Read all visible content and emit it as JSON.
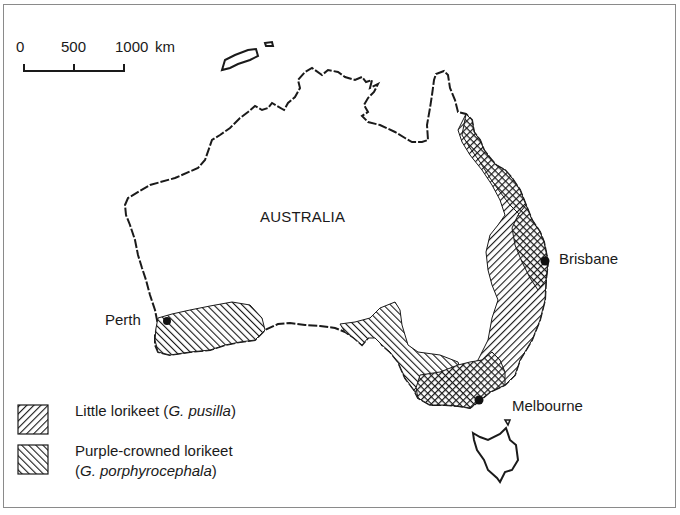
{
  "map": {
    "country_label": "AUSTRALIA",
    "cities": [
      {
        "name": "Perth",
        "x": 167,
        "y": 321
      },
      {
        "name": "Brisbane",
        "x": 545,
        "y": 261
      },
      {
        "name": "Melbourne",
        "x": 479,
        "y": 400
      }
    ]
  },
  "scale_bar": {
    "ticks": [
      "0",
      "500",
      "1000"
    ],
    "unit": "km"
  },
  "legend": {
    "items": [
      {
        "common": "Little lorikeet (",
        "scientific": "G. pusilla",
        "close": ")",
        "pattern": "back-diagonal-hatch"
      },
      {
        "common": "Purple-crowned lorikeet",
        "open": "(",
        "scientific": "G. porphyrocephala",
        "close": ")",
        "pattern": "forward-diagonal-hatch"
      }
    ]
  },
  "colors": {
    "ink": "#1a1a1a",
    "frame": "#8a8a8a",
    "background": "#ffffff"
  }
}
